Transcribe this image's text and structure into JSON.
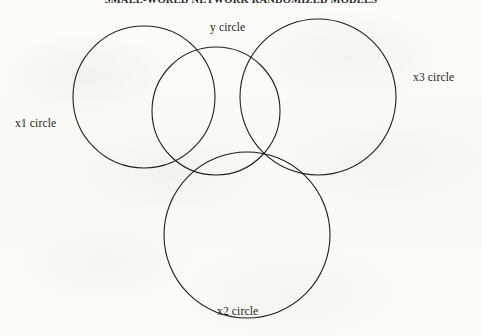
{
  "page": {
    "title_truncated": "SMALL-WORLD NETWORK RANDOMIZED MODELS",
    "background_color": "#fcfbf8",
    "stroke_color": "#1f1f1f",
    "text_color": "#1b1b1b"
  },
  "chart_data": {
    "type": "diagram",
    "subtype": "venn",
    "title": "",
    "xlabel": "",
    "ylabel": "",
    "grid": false,
    "legend_position": "none",
    "fill": "none",
    "stroke_width": 1.1,
    "canvas": {
      "width": 482,
      "height": 336
    },
    "circles": [
      {
        "id": "x1",
        "label": "x1 circle",
        "cx": 144,
        "cy": 97,
        "r": 71,
        "label_x": 15,
        "label_y": 117,
        "label_anchor": "left"
      },
      {
        "id": "y",
        "label": "y circle",
        "cx": 216,
        "cy": 111,
        "r": 64,
        "label_x": 210,
        "label_y": 21,
        "label_anchor": "top"
      },
      {
        "id": "x3",
        "label": "x3 circle",
        "cx": 318,
        "cy": 97,
        "r": 78,
        "label_x": 413,
        "label_y": 71,
        "label_anchor": "right"
      },
      {
        "id": "x2",
        "label": "x2 circle",
        "cx": 247,
        "cy": 235,
        "r": 83,
        "label_x": 217,
        "label_y": 305,
        "label_anchor": "bottom"
      }
    ],
    "labels": [
      "x1 circle",
      "y circle",
      "x3 circle",
      "x2 circle"
    ],
    "overlaps": [
      {
        "pair": [
          "x1",
          "y"
        ],
        "overlapping": true
      },
      {
        "pair": [
          "y",
          "x3"
        ],
        "overlapping": true
      },
      {
        "pair": [
          "x1",
          "x3"
        ],
        "overlapping": false
      },
      {
        "pair": [
          "y",
          "x2"
        ],
        "overlapping": true
      },
      {
        "pair": [
          "x1",
          "x2"
        ],
        "overlapping": true
      },
      {
        "pair": [
          "x3",
          "x2"
        ],
        "overlapping": true
      }
    ]
  }
}
